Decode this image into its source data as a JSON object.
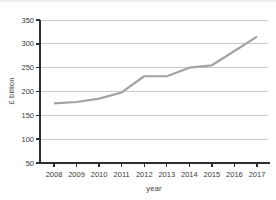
{
  "chart_data": {
    "type": "line",
    "title": "",
    "xlabel": "year",
    "ylabel": "£ billion",
    "categories": [
      "2008",
      "2009",
      "2010",
      "2011",
      "2012",
      "2013",
      "2014",
      "2015",
      "2016",
      "2017"
    ],
    "series": [
      {
        "name": "value",
        "values": [
          175,
          178,
          185,
          198,
          232,
          232,
          250,
          255,
          285,
          315
        ]
      }
    ],
    "ylim": [
      50,
      350
    ],
    "yticks": [
      50,
      100,
      150,
      200,
      250,
      300,
      350
    ],
    "grid": true,
    "legend": "none",
    "colors": {
      "line": "#a3a3a3",
      "grid": "#c9c9c9",
      "axis": "#2e2e2e",
      "tick_label": "#3a3a3a",
      "top_rule": "#ededed",
      "background": "#ffffff"
    }
  }
}
